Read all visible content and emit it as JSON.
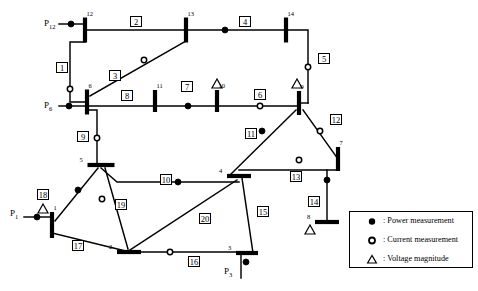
{
  "diagram": {
    "buses": [
      {
        "id": "bus-1",
        "label": "1",
        "x": 52,
        "y": 225,
        "orient": "v",
        "len": 26
      },
      {
        "id": "bus-2",
        "label": "2",
        "x": 129,
        "y": 252,
        "orient": "h",
        "len": 24
      },
      {
        "id": "bus-3",
        "label": "3",
        "x": 247,
        "y": 253,
        "orient": "h",
        "len": 22
      },
      {
        "id": "bus-4",
        "label": "4",
        "x": 239,
        "y": 176,
        "orient": "h",
        "len": 24
      },
      {
        "id": "bus-5",
        "label": "5",
        "x": 101,
        "y": 165,
        "orient": "h",
        "len": 27
      },
      {
        "id": "bus-6",
        "label": "6",
        "x": 87,
        "y": 102,
        "orient": "v",
        "len": 25
      },
      {
        "id": "bus-7",
        "label": "7",
        "x": 338,
        "y": 159,
        "orient": "v",
        "len": 24
      },
      {
        "id": "bus-8",
        "label": "8",
        "x": 327,
        "y": 222,
        "orient": "h",
        "len": 24
      },
      {
        "id": "bus-9",
        "label": "9",
        "x": 299,
        "y": 103,
        "orient": "v",
        "len": 24
      },
      {
        "id": "bus-10",
        "label": "10",
        "x": 217,
        "y": 101,
        "orient": "v",
        "len": 22
      },
      {
        "id": "bus-11",
        "label": "11",
        "x": 155,
        "y": 101,
        "orient": "v",
        "len": 22
      },
      {
        "id": "bus-12",
        "label": "12",
        "x": 85,
        "y": 30,
        "orient": "v",
        "len": 25
      },
      {
        "id": "bus-13",
        "label": "13",
        "x": 186,
        "y": 30,
        "orient": "v",
        "len": 25
      },
      {
        "id": "bus-14",
        "label": "14",
        "x": 286,
        "y": 30,
        "orient": "v",
        "len": 25
      }
    ],
    "line_labels": [
      {
        "id": "line-1",
        "label": "1",
        "x": 56,
        "y": 62
      },
      {
        "id": "line-2",
        "label": "2",
        "x": 130,
        "y": 16
      },
      {
        "id": "line-3",
        "label": "3",
        "x": 109,
        "y": 70
      },
      {
        "id": "line-4",
        "label": "4",
        "x": 239,
        "y": 16
      },
      {
        "id": "line-5",
        "label": "5",
        "x": 318,
        "y": 53
      },
      {
        "id": "line-6",
        "label": "6",
        "x": 254,
        "y": 89
      },
      {
        "id": "line-7",
        "label": "7",
        "x": 181,
        "y": 81
      },
      {
        "id": "line-8",
        "label": "8",
        "x": 121,
        "y": 90
      },
      {
        "id": "line-9",
        "label": "9",
        "x": 77,
        "y": 131
      },
      {
        "id": "line-10",
        "label": "10",
        "x": 160,
        "y": 174
      },
      {
        "id": "line-11",
        "label": "11",
        "x": 245,
        "y": 128
      },
      {
        "id": "line-12",
        "label": "12",
        "x": 330,
        "y": 114
      },
      {
        "id": "line-13",
        "label": "13",
        "x": 290,
        "y": 171
      },
      {
        "id": "line-14",
        "label": "14",
        "x": 308,
        "y": 196
      },
      {
        "id": "line-15",
        "label": "15",
        "x": 257,
        "y": 206
      },
      {
        "id": "line-16",
        "label": "16",
        "x": 188,
        "y": 256
      },
      {
        "id": "line-17",
        "label": "17",
        "x": 72,
        "y": 240
      },
      {
        "id": "line-18",
        "label": "18",
        "x": 37,
        "y": 189
      },
      {
        "id": "line-19",
        "label": "19",
        "x": 115,
        "y": 199
      },
      {
        "id": "line-20",
        "label": "20",
        "x": 199,
        "y": 213
      }
    ],
    "injection_labels": [
      {
        "id": "p12",
        "base": "P",
        "sub": "12",
        "x": 44,
        "y": 18
      },
      {
        "id": "p6",
        "base": "P",
        "sub": "6",
        "x": 44,
        "y": 100
      },
      {
        "id": "p1",
        "base": "P",
        "sub": "1",
        "x": 10,
        "y": 208
      },
      {
        "id": "p3",
        "base": "P",
        "sub": "3",
        "x": 224,
        "y": 266
      }
    ],
    "power_measurements": [
      {
        "id": "pm-bus12-injection",
        "x": 71,
        "y": 24
      },
      {
        "id": "pm-line4",
        "x": 225,
        "y": 30
      },
      {
        "id": "pm-bus6-injection",
        "x": 69,
        "y": 106
      },
      {
        "id": "pm-line7",
        "x": 188,
        "y": 106
      },
      {
        "id": "pm-line11",
        "x": 262,
        "y": 131
      },
      {
        "id": "pm-line10",
        "x": 178,
        "y": 182
      },
      {
        "id": "pm-line14",
        "x": 327,
        "y": 180
      },
      {
        "id": "pm-line18",
        "x": 78,
        "y": 190
      },
      {
        "id": "pm-bus1-injection",
        "x": 37,
        "y": 217
      },
      {
        "id": "pm-bus3-injection",
        "x": 246,
        "y": 262
      }
    ],
    "current_measurements": [
      {
        "id": "cm-line1",
        "x": 70,
        "y": 89
      },
      {
        "id": "cm-line3",
        "x": 144,
        "y": 60
      },
      {
        "id": "cm-line6",
        "x": 260,
        "y": 106
      },
      {
        "id": "cm-line5",
        "x": 308,
        "y": 67
      },
      {
        "id": "cm-line9",
        "x": 97,
        "y": 138
      },
      {
        "id": "cm-line12",
        "x": 320,
        "y": 131
      },
      {
        "id": "cm-line13",
        "x": 299,
        "y": 160
      },
      {
        "id": "cm-line19",
        "x": 102,
        "y": 199
      },
      {
        "id": "cm-line16",
        "x": 170,
        "y": 252
      }
    ],
    "voltage_magnitudes": [
      {
        "id": "vm-bus10",
        "x": 217,
        "y": 84
      },
      {
        "id": "vm-bus9",
        "x": 297,
        "y": 84
      },
      {
        "id": "vm-bus1",
        "x": 43,
        "y": 209
      },
      {
        "id": "vm-bus8",
        "x": 310,
        "y": 230
      }
    ]
  },
  "legend": {
    "rows": [
      {
        "id": "legend-power",
        "symbol": "filled-circle",
        "text": ": Power measurement"
      },
      {
        "id": "legend-current",
        "symbol": "open-circle",
        "text": ": Current measurement"
      },
      {
        "id": "legend-voltage",
        "symbol": "triangle",
        "text": ": Voltage magnitude"
      }
    ]
  },
  "colors": {
    "line": "#000000",
    "background": "#ffffff"
  }
}
